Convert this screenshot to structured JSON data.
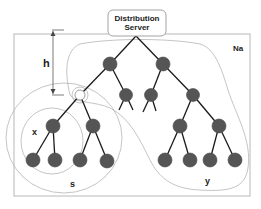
{
  "server": {
    "line1": "Distribution",
    "line2": "Server"
  },
  "labels": {
    "height": "h",
    "outer_region": "Na",
    "subtree_x": "x",
    "subtree_s": "s",
    "region_y": "y"
  },
  "colors": {
    "node_fill": "#555555",
    "edge": "#1a1a1a",
    "frame": "#b8b8b8",
    "region_outline": "#b5b5b5"
  },
  "tree": {
    "root": "Distribution Server",
    "levels": 4,
    "highlighted_node": "white node at level 2 (root of subtree s)"
  }
}
